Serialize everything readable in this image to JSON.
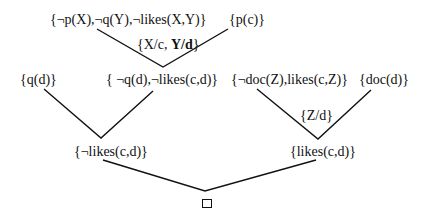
{
  "diagram": {
    "type": "resolution-refutation-tree",
    "nodes": {
      "c1": "{¬p(X),¬q(Y),¬likes(X,Y)}",
      "c2": "{p(c)}",
      "sub1_a": "{X/c, ",
      "sub1_b": "Y/d",
      "sub1_c": "}",
      "c3": "{q(d)}",
      "c4": "{ ¬q(d),¬likes(c,d)}",
      "c5": "{¬doc(Z),likes(c,Z)}",
      "c6": "{doc(d)}",
      "sub2": "{Z/d}",
      "c7": "{¬likes(c,d)}",
      "c8": "{likes(c,d)}",
      "empty_clause": "□"
    },
    "edges": [
      [
        "c1",
        "c4"
      ],
      [
        "c2",
        "c4"
      ],
      [
        "c3",
        "c7"
      ],
      [
        "c4",
        "c7"
      ],
      [
        "c5",
        "c8"
      ],
      [
        "c6",
        "c8"
      ],
      [
        "c7",
        "empty"
      ],
      [
        "c8",
        "empty"
      ]
    ],
    "line_color": "#111111"
  }
}
